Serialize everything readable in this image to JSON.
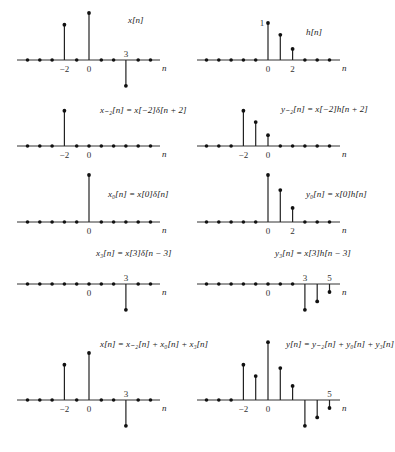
{
  "figure": {
    "panels": [
      {
        "id": "x",
        "title": "x[n]",
        "title_parts": [
          {
            "t": "x",
            "i": true
          },
          {
            "t": "[",
            "i": false
          },
          {
            "t": "n",
            "i": true
          },
          {
            "t": "]",
            "i": false
          }
        ],
        "axis_label": "n",
        "ticks": [
          {
            "n": -2,
            "label": "−2"
          },
          {
            "n": 0,
            "label": "0"
          },
          {
            "n": 3,
            "label": "3",
            "above": true
          }
        ],
        "samples": [
          {
            "n": -2,
            "v": 0.75
          },
          {
            "n": 0,
            "v": 1.0
          },
          {
            "n": 3,
            "v": -0.55
          }
        ]
      },
      {
        "id": "h",
        "title": "h[n]",
        "axis_label": "n",
        "value_label": "1",
        "ticks": [
          {
            "n": 0,
            "label": "0"
          },
          {
            "n": 2,
            "label": "2"
          }
        ],
        "samples": [
          {
            "n": 0,
            "v": 1.0
          },
          {
            "n": 1,
            "v": 0.68
          },
          {
            "n": 2,
            "v": 0.3
          }
        ]
      },
      {
        "id": "x_m2",
        "title": "x₋₂[n] = x[−2]δ[n + 2]",
        "axis_label": "n",
        "ticks": [
          {
            "n": -2,
            "label": "−2"
          },
          {
            "n": 0,
            "label": "0"
          }
        ],
        "samples": [
          {
            "n": -2,
            "v": 0.75
          }
        ]
      },
      {
        "id": "y_m2",
        "title": "y₋₂[n] = x[−2]h[n + 2]",
        "axis_label": "n",
        "ticks": [
          {
            "n": -2,
            "label": "−2"
          },
          {
            "n": 0,
            "label": "0"
          }
        ],
        "samples": [
          {
            "n": -2,
            "v": 0.75
          },
          {
            "n": -1,
            "v": 0.51
          },
          {
            "n": 0,
            "v": 0.23
          }
        ]
      },
      {
        "id": "x_0",
        "title": "x₀[n] = x[0]δ[n]",
        "axis_label": "n",
        "ticks": [
          {
            "n": 0,
            "label": "0"
          }
        ],
        "samples": [
          {
            "n": 0,
            "v": 1.0
          }
        ]
      },
      {
        "id": "y_0",
        "title": "y₀[n] = x[0]h[n]",
        "axis_label": "n",
        "ticks": [
          {
            "n": 0,
            "label": "0"
          },
          {
            "n": 2,
            "label": "2"
          }
        ],
        "samples": [
          {
            "n": 0,
            "v": 1.0
          },
          {
            "n": 1,
            "v": 0.68
          },
          {
            "n": 2,
            "v": 0.3
          }
        ]
      },
      {
        "id": "x_3",
        "title": "x₃[n] = x[3]δ[n − 3]",
        "axis_label": "n",
        "ticks": [
          {
            "n": 0,
            "label": "0"
          },
          {
            "n": 3,
            "label": "3",
            "above": true
          }
        ],
        "samples": [
          {
            "n": 3,
            "v": -0.55
          }
        ]
      },
      {
        "id": "y_3",
        "title": "y₃[n] = x[3]h[n − 3]",
        "axis_label": "n",
        "ticks": [
          {
            "n": 0,
            "label": "0"
          },
          {
            "n": 3,
            "label": "3",
            "above": true
          },
          {
            "n": 5,
            "label": "5",
            "above": true
          }
        ],
        "samples": [
          {
            "n": 3,
            "v": -0.55
          },
          {
            "n": 4,
            "v": -0.37
          },
          {
            "n": 5,
            "v": -0.17
          }
        ]
      },
      {
        "id": "x_sum",
        "title": "x[n] = x₋₂[n] + x₀[n] + x₃[n]",
        "axis_label": "n",
        "ticks": [
          {
            "n": -2,
            "label": "−2"
          },
          {
            "n": 0,
            "label": "0"
          },
          {
            "n": 3,
            "label": "3",
            "above": true
          }
        ],
        "samples": [
          {
            "n": -2,
            "v": 0.75
          },
          {
            "n": 0,
            "v": 1.0
          },
          {
            "n": 3,
            "v": -0.55
          }
        ]
      },
      {
        "id": "y_sum",
        "title": "y[n] = y₋₂[n] + y₀[n] + y₃[n]",
        "axis_label": "n",
        "ticks": [
          {
            "n": -2,
            "label": "−2"
          },
          {
            "n": 0,
            "label": "0"
          },
          {
            "n": 5,
            "label": "5",
            "above": true
          }
        ],
        "samples": [
          {
            "n": -2,
            "v": 0.75
          },
          {
            "n": -1,
            "v": 0.51
          },
          {
            "n": 0,
            "v": 1.23
          },
          {
            "n": 1,
            "v": 0.68
          },
          {
            "n": 2,
            "v": 0.3
          },
          {
            "n": 3,
            "v": -0.55
          },
          {
            "n": 4,
            "v": -0.37
          },
          {
            "n": 5,
            "v": -0.17
          }
        ]
      }
    ]
  }
}
